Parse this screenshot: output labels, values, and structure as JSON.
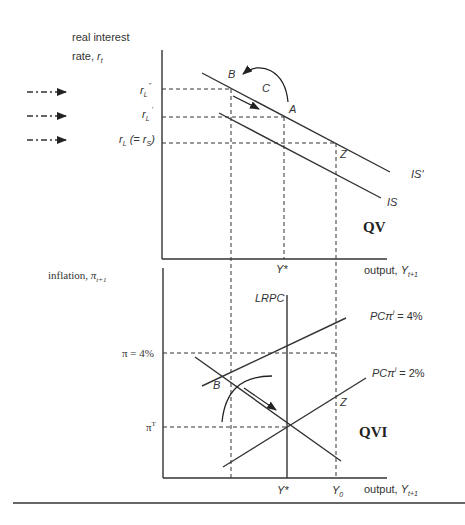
{
  "top_panel": {
    "quadrant": "QV",
    "y_axis_label_line1": "real interest",
    "y_axis_label_line2": "rate, ",
    "y_axis_symbol": "r",
    "y_axis_subscript": "t",
    "x_axis_label": "output, ",
    "x_axis_symbol": "Y",
    "x_axis_subscript": "t+1",
    "y_ticks": [
      {
        "main": "r",
        "sub": "L",
        "sup": "\"",
        "tail": ""
      },
      {
        "main": "r",
        "sub": "L",
        "sup": "'",
        "tail": ""
      },
      {
        "main": "r",
        "sub": "L",
        "sup": "",
        "tail": " (= r",
        "tail_sub": "S",
        "tail_end": ")"
      }
    ],
    "x_ticks": [
      "Y*"
    ],
    "curves": [
      "IS'",
      "IS"
    ],
    "points": [
      "A",
      "B",
      "C",
      "Z"
    ]
  },
  "bottom_panel": {
    "quadrant": "QVI",
    "y_axis_label": "inflation, ",
    "y_axis_symbol": "π",
    "y_axis_subscript": "t+1",
    "x_axis_label": "output, ",
    "x_axis_symbol": "Y",
    "x_axis_subscript": "t+1",
    "y_ticks": [
      "π = 4%",
      "π",
      "T"
    ],
    "x_ticks": [
      "Y*",
      "Y",
      "0"
    ],
    "curves": {
      "lrpc": "LRPC",
      "pc4_prefix": "PCπ",
      "pc4_sup": "i",
      "pc4_suffix": " = 4%",
      "pc2_prefix": "PCπ",
      "pc2_sup": "i",
      "pc2_suffix": " = 2%"
    },
    "points": [
      "B",
      "Z"
    ]
  },
  "side_arrows": 3,
  "colors": {
    "line": "#333333",
    "background": "#ffffff"
  }
}
